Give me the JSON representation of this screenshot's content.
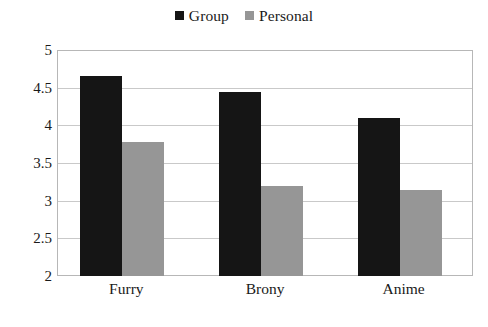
{
  "chart_data": {
    "type": "bar",
    "title": "",
    "subtitle": "",
    "xlabel": "",
    "ylabel": "",
    "categories": [
      "Furry",
      "Brony",
      "Anime"
    ],
    "series": [
      {
        "name": "Group",
        "color": "#151515",
        "values": [
          4.65,
          4.44,
          4.1
        ]
      },
      {
        "name": "Personal",
        "color": "#969696",
        "values": [
          3.78,
          3.2,
          3.14
        ]
      }
    ],
    "ylim": [
      2,
      5
    ],
    "yticks": [
      2,
      2.5,
      3,
      3.5,
      4,
      4.5,
      5
    ],
    "ytick_labels": [
      "2",
      "2.5",
      "3",
      "3.5",
      "4",
      "4.5",
      "5"
    ],
    "grid": true,
    "grid_axis": "y",
    "legend_position": "top-center",
    "annotations": []
  },
  "legend": {
    "entries": [
      {
        "label": "Group",
        "swatch": "black-square-icon",
        "color": "#151515"
      },
      {
        "label": "Personal",
        "swatch": "gray-square-icon",
        "color": "#969696"
      }
    ]
  },
  "colors": {
    "background": "#ffffff",
    "plot_border": "#b7b7b7",
    "gridline": "#c9c9c9",
    "text": "#1a1a1a",
    "series_group": "#151515",
    "series_personal": "#969696"
  }
}
